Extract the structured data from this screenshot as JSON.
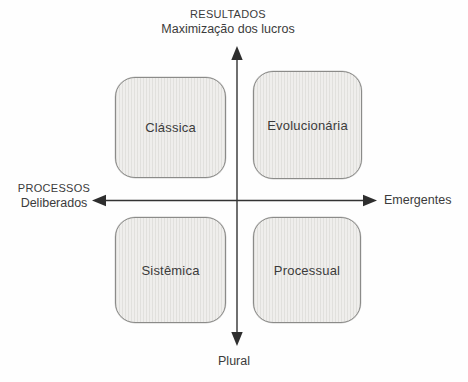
{
  "diagram": {
    "type": "quadrant-matrix",
    "axis_top": {
      "line1": "RESULTADOS",
      "line2": "Maximização dos lucros"
    },
    "axis_left": {
      "line1": "PROCESSOS",
      "line2": "Deliberados"
    },
    "axis_right": {
      "label": "Emergentes"
    },
    "axis_bottom": {
      "label": "Plural"
    },
    "quadrants": [
      {
        "position": "top-left",
        "label": "Clássica"
      },
      {
        "position": "top-right",
        "label": "Evolucionária"
      },
      {
        "position": "bottom-left",
        "label": "Sistêmica"
      },
      {
        "position": "bottom-right",
        "label": "Processual"
      }
    ],
    "colors": {
      "box_fill": "#efeeec",
      "box_border": "#8b8b89",
      "axis_line": "#333333",
      "text": "#3b3b3b",
      "background": "#fefefe"
    }
  }
}
